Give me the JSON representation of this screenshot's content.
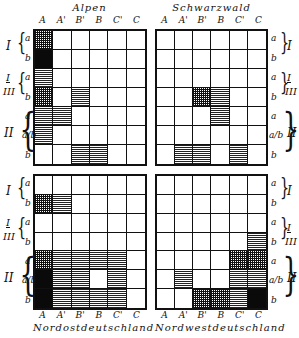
{
  "columns": [
    "A",
    "A'",
    "B'",
    "B",
    "C'",
    "C"
  ],
  "rows": [
    {
      "group": "I",
      "label": "a"
    },
    {
      "group": "I",
      "label": "b"
    },
    {
      "group": "I/III",
      "label": "a"
    },
    {
      "group": "I/III",
      "label": "b"
    },
    {
      "group": "II",
      "label": "a"
    },
    {
      "group": "II",
      "label": "a/b"
    },
    {
      "group": "II",
      "label": "b"
    }
  ],
  "groups": {
    "g1": "I",
    "g2_top": "I",
    "g2_bottom": "III",
    "g3": "II"
  },
  "legend_patterns": {
    "empty": "white",
    "horiz": "horizontal hatching",
    "cross": "dense crosshatching",
    "black": "solid black"
  },
  "panels": {
    "tl": {
      "title": "Alpen",
      "cells": [
        [
          "cross",
          "empty",
          "empty",
          "empty",
          "empty",
          "empty"
        ],
        [
          "black",
          "empty",
          "empty",
          "empty",
          "empty",
          "empty"
        ],
        [
          "horiz",
          "empty",
          "empty",
          "empty",
          "empty",
          "empty"
        ],
        [
          "cross",
          "empty",
          "horiz",
          "empty",
          "empty",
          "empty"
        ],
        [
          "horiz",
          "horiz",
          "empty",
          "empty",
          "empty",
          "empty"
        ],
        [
          "horiz",
          "empty",
          "empty",
          "empty",
          "empty",
          "empty"
        ],
        [
          "empty",
          "empty",
          "horiz",
          "horiz",
          "empty",
          "empty"
        ]
      ]
    },
    "tr": {
      "title": "Schwarzwald",
      "cells": [
        [
          "empty",
          "empty",
          "empty",
          "empty",
          "empty",
          "empty"
        ],
        [
          "empty",
          "empty",
          "empty",
          "empty",
          "empty",
          "empty"
        ],
        [
          "empty",
          "empty",
          "empty",
          "empty",
          "empty",
          "empty"
        ],
        [
          "empty",
          "empty",
          "cross",
          "horiz",
          "empty",
          "empty"
        ],
        [
          "empty",
          "empty",
          "empty",
          "horiz",
          "empty",
          "empty"
        ],
        [
          "empty",
          "empty",
          "empty",
          "empty",
          "empty",
          "empty"
        ],
        [
          "empty",
          "horiz",
          "horiz",
          "empty",
          "horiz",
          "empty"
        ]
      ]
    },
    "bl": {
      "title": "Nordostdeutschland",
      "cells": [
        [
          "empty",
          "empty",
          "empty",
          "empty",
          "empty",
          "empty"
        ],
        [
          "cross",
          "horiz",
          "empty",
          "empty",
          "empty",
          "empty"
        ],
        [
          "empty",
          "empty",
          "empty",
          "empty",
          "empty",
          "empty"
        ],
        [
          "empty",
          "empty",
          "empty",
          "empty",
          "empty",
          "empty"
        ],
        [
          "cross",
          "horiz",
          "horiz",
          "horiz",
          "horiz",
          "empty"
        ],
        [
          "black",
          "horiz",
          "horiz",
          "empty",
          "horiz",
          "empty"
        ],
        [
          "black",
          "horiz",
          "horiz",
          "horiz",
          "horiz",
          "empty"
        ]
      ]
    },
    "br": {
      "title": "Nordwestdeutschland",
      "cells": [
        [
          "empty",
          "empty",
          "empty",
          "empty",
          "empty",
          "empty"
        ],
        [
          "empty",
          "empty",
          "empty",
          "empty",
          "empty",
          "empty"
        ],
        [
          "empty",
          "empty",
          "empty",
          "empty",
          "empty",
          "empty"
        ],
        [
          "empty",
          "empty",
          "empty",
          "empty",
          "empty",
          "horiz"
        ],
        [
          "empty",
          "empty",
          "empty",
          "empty",
          "cross",
          "cross"
        ],
        [
          "empty",
          "horiz",
          "empty",
          "empty",
          "horiz",
          "horiz"
        ],
        [
          "empty",
          "empty",
          "cross",
          "cross",
          "horiz",
          "black"
        ]
      ]
    }
  }
}
